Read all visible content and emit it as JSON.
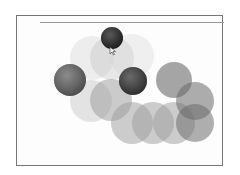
{
  "game": {
    "frame": {
      "x": 16,
      "y": 15,
      "w": 207,
      "h": 151
    },
    "top_line": {
      "x": 40,
      "y": 22,
      "w": 184
    },
    "circles": [
      {
        "cx": 92,
        "cy": 58,
        "r": 22,
        "fill": "#cfcfcf",
        "opacity": 0.35,
        "kind": "ghost"
      },
      {
        "cx": 112,
        "cy": 58,
        "r": 22,
        "fill": "#bdbdbd",
        "opacity": 0.35,
        "kind": "ghost"
      },
      {
        "cx": 132,
        "cy": 56,
        "r": 22,
        "fill": "#d4d4d4",
        "opacity": 0.35,
        "kind": "ghost"
      },
      {
        "cx": 91,
        "cy": 101,
        "r": 21,
        "fill": "#c4c4c4",
        "opacity": 0.45,
        "kind": "ghost"
      },
      {
        "cx": 111,
        "cy": 100,
        "r": 21,
        "fill": "#9a9a9a",
        "opacity": 0.5,
        "kind": "ghost"
      },
      {
        "cx": 132,
        "cy": 123,
        "r": 21,
        "fill": "#9c9c9c",
        "opacity": 0.5,
        "kind": "ghost"
      },
      {
        "cx": 153,
        "cy": 123,
        "r": 21,
        "fill": "#9c9c9c",
        "opacity": 0.5,
        "kind": "ghost"
      },
      {
        "cx": 174,
        "cy": 123,
        "r": 21,
        "fill": "#9c9c9c",
        "opacity": 0.5,
        "kind": "ghost"
      },
      {
        "cx": 195,
        "cy": 123,
        "r": 19,
        "fill": "#6e6e6e",
        "opacity": 0.55,
        "kind": "ghost"
      },
      {
        "cx": 174,
        "cy": 80,
        "r": 18,
        "fill": "#6a6a6a",
        "opacity": 0.6,
        "kind": "ghost"
      },
      {
        "cx": 195,
        "cy": 101,
        "r": 19,
        "fill": "#6a6a6a",
        "opacity": 0.55,
        "kind": "ghost"
      },
      {
        "cx": 70,
        "cy": 80,
        "r": 16,
        "fill": "#4a4a4a",
        "opacity": 0.85,
        "kind": "ball"
      },
      {
        "cx": 133,
        "cy": 81,
        "r": 14,
        "fill": "#2e2e2e",
        "opacity": 0.95,
        "kind": "ball"
      },
      {
        "cx": 112,
        "cy": 38,
        "r": 11,
        "fill": "#222222",
        "opacity": 1.0,
        "kind": "ball"
      }
    ],
    "cursor": {
      "x": 110,
      "y": 47
    }
  }
}
